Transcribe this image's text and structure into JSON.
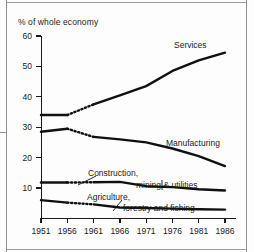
{
  "chart_data": {
    "type": "line",
    "title": "",
    "subtitle": "",
    "ylabel": "% of whole economy",
    "xlabel": "",
    "x": [
      1951,
      1956,
      1961,
      1966,
      1971,
      1976,
      1981,
      1986
    ],
    "xticklabels": [
      "1951",
      "1956",
      "1961",
      "1966",
      "1971",
      "1976",
      "1981",
      "1986"
    ],
    "yticklabels": [
      "60",
      "50",
      "40",
      "30",
      "20",
      "10"
    ],
    "yticks": [
      60,
      50,
      40,
      30,
      20,
      10
    ],
    "ylim": [
      0,
      60
    ],
    "xlim": [
      1951,
      1986
    ],
    "grid": false,
    "legend_position": "inline-annotations",
    "note": "Dotted line segments between 1956 and 1961 indicate a discontinuity in the series",
    "series": [
      {
        "name": "Services",
        "values": [
          34.0,
          34.0,
          37.5,
          40.5,
          43.5,
          48.5,
          52.0,
          54.5
        ],
        "label": "Services"
      },
      {
        "name": "Manufacturing",
        "values": [
          28.5,
          29.5,
          26.8,
          26.0,
          25.0,
          23.0,
          20.5,
          17.2
        ],
        "label": "Manufacturing"
      },
      {
        "name": "Construction, mining & utilities",
        "values": [
          11.8,
          11.8,
          11.9,
          12.0,
          10.6,
          10.3,
          9.6,
          9.2
        ],
        "label": "Construction, mining & utilities"
      },
      {
        "name": "Agriculture, forestry and fishing",
        "values": [
          6.0,
          5.2,
          4.6,
          3.6,
          3.4,
          3.2,
          3.0,
          2.9
        ],
        "label": "Agriculture, forestry and fishing"
      }
    ],
    "annotations": [
      {
        "text": "Services",
        "series": "Services"
      },
      {
        "text": "Manufacturing",
        "series": "Manufacturing"
      },
      {
        "text": "Construction,",
        "series": "Construction, mining & utilities"
      },
      {
        "text": "mining & utilities",
        "series": "Construction, mining & utilities"
      },
      {
        "text": "Agriculture,",
        "series": "Agriculture, forestry and fishing"
      },
      {
        "text": "forestry and fishing",
        "series": "Agriculture, forestry and fishing"
      }
    ]
  },
  "figure": {
    "axis_title": "% of whole economy",
    "ink_color": "#101010"
  }
}
